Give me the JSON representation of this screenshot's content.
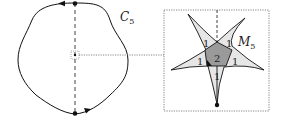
{
  "diagram": {
    "left": {
      "curve_label": "C",
      "curve_subscript": "5"
    },
    "right": {
      "region_label": "M",
      "region_subscript": "5",
      "multiplicities": {
        "top_left": "1",
        "top_right": "1",
        "left": "1",
        "right": "1",
        "center": "2",
        "bottom": "1"
      }
    },
    "colors": {
      "stroke": "#111111",
      "light_fill": "#e6e6e6",
      "dark_fill": "#9a9a9a",
      "dotted": "#666666"
    }
  }
}
